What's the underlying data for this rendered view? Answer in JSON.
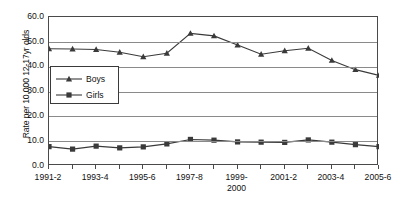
{
  "chart_data": {
    "type": "line",
    "title": "",
    "xlabel": "",
    "ylabel": "Rate per 10,000 12-17yr olds",
    "ylim": [
      0,
      60
    ],
    "ytick_values": [
      60.0,
      50.0,
      40.0,
      30.0,
      20.0,
      10.0,
      0.0
    ],
    "ytick_labels": [
      "60.0",
      "50.0",
      "40.0",
      "30.0",
      "20.0",
      "10.0",
      "0.0"
    ],
    "grid": "horizontal",
    "legend_position": "upper-left-inside",
    "categories": [
      "1991-2",
      "1992-3",
      "1993-4",
      "1994-5",
      "1995-6",
      "1996-7",
      "1997-8",
      "1998-9",
      "1999-2000",
      "2000-1",
      "2001-2",
      "2002-3",
      "2003-4",
      "2004-5",
      "2005-6"
    ],
    "xtick_labels_shown": [
      "1991-2",
      "",
      "1993-4",
      "",
      "1995-6",
      "",
      "1997-8",
      "",
      "1999-\n2000",
      "",
      "2001-2",
      "",
      "2003-4",
      "",
      "2005-6"
    ],
    "series": [
      {
        "name": "Boys",
        "marker": "triangle",
        "color": "#3a3a3a",
        "values": [
          47.2,
          47.1,
          46.9,
          45.8,
          44.0,
          45.4,
          53.4,
          52.4,
          48.7,
          45.0,
          46.4,
          47.4,
          42.5,
          38.8,
          36.5
        ]
      },
      {
        "name": "Girls",
        "marker": "square",
        "color": "#3a3a3a",
        "values": [
          7.8,
          6.8,
          8.0,
          7.3,
          7.7,
          8.9,
          10.7,
          10.4,
          9.7,
          9.6,
          9.5,
          10.5,
          9.6,
          8.6,
          7.8
        ]
      }
    ]
  },
  "legend": {
    "items": [
      {
        "label": "Boys",
        "marker": "triangle"
      },
      {
        "label": "Girls",
        "marker": "square"
      }
    ]
  }
}
